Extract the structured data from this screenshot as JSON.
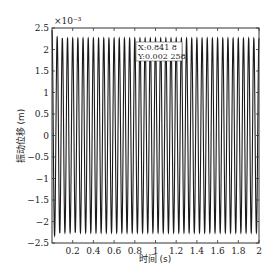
{
  "chart_data": {
    "type": "line",
    "title": "",
    "xlabel": "时间 (s)",
    "ylabel": "振动位移 (m)",
    "y_exponent_label": "×10⁻³",
    "xlim": [
      0,
      2
    ],
    "ylim": [
      -2.5,
      2.5
    ],
    "x_ticks": [
      0.2,
      0.4,
      0.6,
      0.8,
      1,
      1.2,
      1.4,
      1.6,
      1.8,
      2
    ],
    "x_tick_labels": [
      "0.2",
      "0.4",
      "0.6",
      "0.8",
      "1",
      "1.2",
      "1.4",
      "1.6",
      "1.8",
      "2"
    ],
    "y_ticks": [
      -2.5,
      -2,
      -1.5,
      -1,
      -0.5,
      0,
      0.5,
      1,
      1.5,
      2,
      2.5
    ],
    "y_tick_labels": [
      "−2.5",
      "−2",
      "−1.5",
      "−1",
      "−0.5",
      "0",
      "0.5",
      "1",
      "1.5",
      "2",
      "2.5"
    ],
    "grid": false,
    "legend": null,
    "series": [
      {
        "name": "vibration displacement",
        "description": "steady sinusoidal oscillation with initial transient overshoot",
        "amplitude_e-3": 2.258,
        "initial_peak_e-3": 2.45,
        "frequency_hz": 20,
        "x_start": 0.0,
        "x_end": 2.0,
        "color": "#1a1a1a"
      }
    ],
    "annotations": [
      {
        "type": "datatip",
        "x_label": "X:0.841 8",
        "y_label": "Y:0.002 258",
        "x": 0.8418,
        "y": 0.002258
      }
    ]
  }
}
